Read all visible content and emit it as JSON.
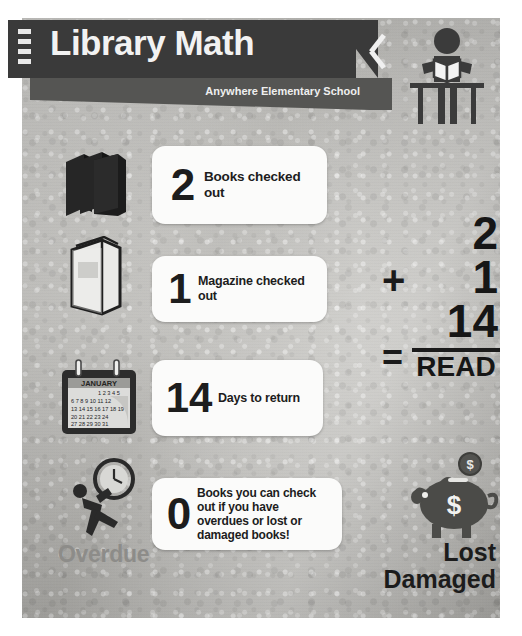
{
  "poster": {
    "header": {
      "title": "Library Math",
      "subtitle": "Anywhere Elementary School",
      "reader_icon": "person-reading-icon",
      "chevron_icon": "double-chevron-left-icon"
    },
    "rows": [
      {
        "icon": "stack-of-books-icon",
        "number": "2",
        "text": "Books checked out"
      },
      {
        "icon": "open-magazine-icon",
        "number": "1",
        "text": "Magazine checked out"
      },
      {
        "icon": "calendar-icon",
        "number": "14",
        "text": "Days to return",
        "calendar": {
          "month": "JANUARY",
          "weeks": [
            [
              "",
              "",
              "",
              "1",
              "2",
              "3",
              "4",
              "5"
            ],
            [
              "6",
              "7",
              "8",
              "9",
              "10",
              "11",
              "12"
            ],
            [
              "13",
              "14",
              "15",
              "16",
              "17",
              "18",
              "19"
            ],
            [
              "20",
              "21",
              "22",
              "23",
              "24",
              "",
              ""
            ],
            [
              "27",
              "28",
              "29",
              "30",
              "31",
              "",
              ""
            ]
          ]
        }
      },
      {
        "icon": "overdue-clock-carrier-icon",
        "number": "0",
        "text": "Books you can check out if you have overdues or lost or damaged books!"
      }
    ],
    "math": {
      "plus": "+",
      "equals": "=",
      "operand_1": "2",
      "operand_2": "1",
      "operand_3": "14",
      "result": "READ"
    },
    "footer": {
      "overdue_label": "Overdue",
      "lost_label": "Lost",
      "damaged_label": "Damaged",
      "piggy_icon": "piggy-bank-icon",
      "coin_symbol": "$"
    },
    "colors": {
      "banner": "#3a3a3a",
      "banner_sub": "#555553",
      "paper": "#bdbcb8",
      "card": "#fbfbfa",
      "ink": "#1b1b1b",
      "overdue_gray": "#8d8c89"
    }
  }
}
